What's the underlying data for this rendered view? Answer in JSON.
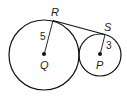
{
  "diagram": {
    "type": "tangent-circles",
    "circles": [
      {
        "center": "Q",
        "radius_label": "5",
        "cx": 44,
        "cy": 55,
        "r": 35
      },
      {
        "center": "P",
        "radius_label": "3",
        "cx": 100,
        "cy": 55,
        "r": 21
      }
    ],
    "points": {
      "R": "R",
      "S": "S",
      "Q": "Q",
      "P": "P"
    },
    "segments": [
      "QR",
      "PS",
      "RS"
    ],
    "labels": {
      "radius_big": "5",
      "radius_small": "3"
    },
    "colors": {
      "stroke": "#111111",
      "text": "#222222",
      "background": "#ffffff"
    }
  }
}
